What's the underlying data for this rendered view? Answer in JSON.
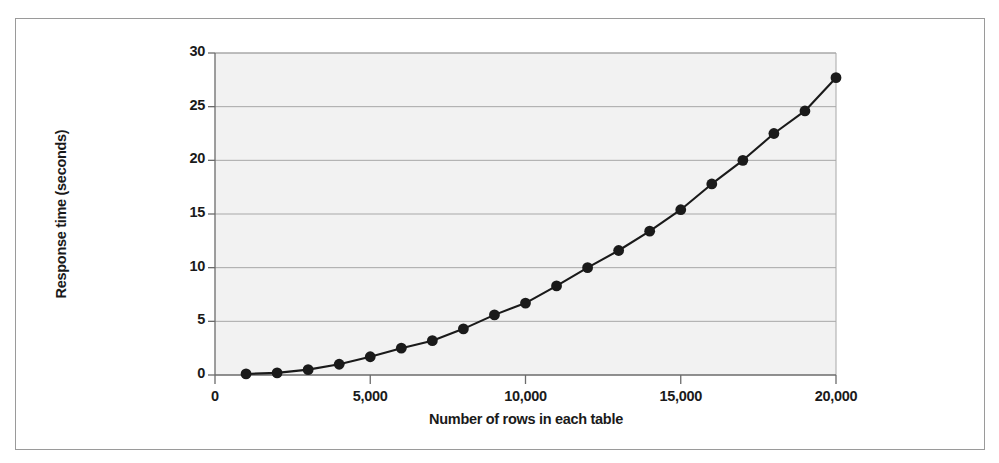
{
  "chart_data": {
    "type": "line",
    "title": "",
    "xlabel": "Number of rows in each table",
    "ylabel": "Response time (seconds)",
    "xlim": [
      0,
      20000
    ],
    "ylim": [
      0,
      30
    ],
    "xticks": [
      0,
      5000,
      10000,
      15000,
      20000
    ],
    "xtick_labels": [
      "0",
      "5,000",
      "10,000",
      "15,000",
      "20,000"
    ],
    "yticks": [
      0,
      5,
      10,
      15,
      20,
      25,
      30
    ],
    "ytick_labels": [
      "0",
      "5",
      "10",
      "15",
      "20",
      "25",
      "30"
    ],
    "grid": true,
    "grid_axis": "y",
    "legend": false,
    "marker": "filled-circle",
    "line_color": "#1a1a1a",
    "marker_color": "#1a1a1a",
    "plot_background": "#f2f2f2",
    "grid_color": "#a8a8a8",
    "x": [
      1000,
      2000,
      3000,
      4000,
      5000,
      6000,
      7000,
      8000,
      9000,
      10000,
      11000,
      12000,
      13000,
      14000,
      15000,
      16000,
      17000,
      18000,
      19000,
      20000
    ],
    "values": [
      0.1,
      0.2,
      0.5,
      1.0,
      1.7,
      2.5,
      3.2,
      4.3,
      5.6,
      6.7,
      8.3,
      10.0,
      11.6,
      13.4,
      15.4,
      17.8,
      20.0,
      22.5,
      24.6,
      27.7
    ],
    "series": [
      {
        "name": "Response time",
        "values": [
          0.1,
          0.2,
          0.5,
          1.0,
          1.7,
          2.5,
          3.2,
          4.3,
          5.6,
          6.7,
          8.3,
          10.0,
          11.6,
          13.4,
          15.4,
          17.8,
          20.0,
          22.5,
          24.6,
          27.7
        ]
      }
    ]
  }
}
